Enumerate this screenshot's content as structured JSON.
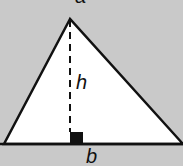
{
  "diagram": {
    "type": "triangle-area",
    "background_color": "#c9c9c9",
    "fill_color": "#ffffff",
    "stroke_color": "#111111",
    "labels": {
      "height": "h",
      "base": "b",
      "top_partial": "a"
    },
    "elements": [
      "triangle",
      "dashed-altitude",
      "right-angle-marker",
      "base-line"
    ]
  }
}
